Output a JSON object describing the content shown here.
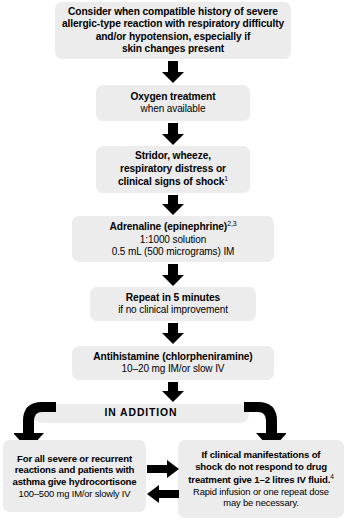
{
  "diagram": {
    "background_color": "#ffffff",
    "node_fill_color": "#ececec",
    "arrow_color": "#000000",
    "nodes": {
      "consider": {
        "lines": [
          "Consider when compatible history of severe",
          "allergic-type reaction with respiratory difficulty",
          "and/or hypotension, especially if",
          "skin changes present"
        ]
      },
      "oxygen": {
        "heading": "Oxygen treatment",
        "detail": "when available"
      },
      "stridor": {
        "line1": "Stridor, wheeze,",
        "line2": "respiratory distress or",
        "line3": "clinical signs of shock",
        "line3_sup": "1"
      },
      "adrenaline": {
        "heading": "Adrenaline (epinephrine)",
        "heading_sup": "2,3",
        "detail1": "1:1000 solution",
        "detail2": "0.5 mL (500 micrograms) IM"
      },
      "repeat": {
        "heading": "Repeat in 5 minutes",
        "detail": "if no clinical improvement"
      },
      "antihistamine": {
        "heading": "Antihistamine (chlorpheniramine)",
        "detail": "10–20 mg IM/or slow IV"
      },
      "in_addition": {
        "label": "IN ADDITION"
      },
      "hydrocortisone": {
        "line1": "For all severe or recurrent",
        "line2": "reactions and patients with",
        "line3": "asthma give hydrocortisone",
        "detail": "100–500 mg IM/or slowly IV"
      },
      "iv_fluid": {
        "line1": "If clinical manifestations of",
        "line2": "shock do not respond to drug",
        "line3": "treatment give 1–2 litres IV fluid.",
        "line3_sup": "4",
        "detail1": "Rapid infusion or one repeat dose",
        "detail2": "may be necessary."
      }
    },
    "connectors": [
      {
        "name": "consider-to-oxygen",
        "type": "arrow-down"
      },
      {
        "name": "oxygen-to-stridor",
        "type": "arrow-down"
      },
      {
        "name": "stridor-to-adrenaline",
        "type": "arrow-down"
      },
      {
        "name": "adrenaline-to-repeat",
        "type": "arrow-down"
      },
      {
        "name": "repeat-to-antihistamine",
        "type": "arrow-down"
      },
      {
        "name": "antihistamine-to-in-addition",
        "type": "arrow-down"
      },
      {
        "name": "in-addition-to-hydrocortisone",
        "type": "elbow-left"
      },
      {
        "name": "in-addition-to-iv-fluid",
        "type": "elbow-right"
      },
      {
        "name": "hydrocortisone-to-iv-fluid",
        "type": "arrow-right"
      },
      {
        "name": "iv-fluid-to-hydrocortisone",
        "type": "arrow-left"
      }
    ]
  }
}
